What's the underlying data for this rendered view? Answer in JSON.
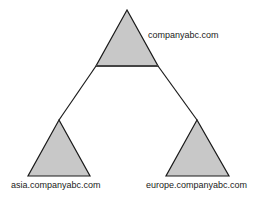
{
  "diagram": {
    "type": "domain-tree",
    "colors": {
      "triangle_fill": "#c8c8c8",
      "stroke": "#1a1a1a",
      "base_stroke": "#444444",
      "background": "#ffffff"
    },
    "root": {
      "label": "companyabc.com",
      "apex": [
        127,
        10
      ],
      "base_left": [
        96,
        66
      ],
      "base_right": [
        158,
        66
      ]
    },
    "children": [
      {
        "label": "asia.companyabc.com",
        "apex": [
          59,
          120
        ],
        "base_left": [
          28,
          176
        ],
        "base_right": [
          90,
          176
        ]
      },
      {
        "label": "europe.companyabc.com",
        "apex": [
          197,
          120
        ],
        "base_left": [
          166,
          176
        ],
        "base_right": [
          229,
          176
        ]
      }
    ],
    "connectors": [
      {
        "from": "companyabc.com",
        "to": "asia.companyabc.com"
      },
      {
        "from": "companyabc.com",
        "to": "europe.companyabc.com"
      }
    ]
  }
}
